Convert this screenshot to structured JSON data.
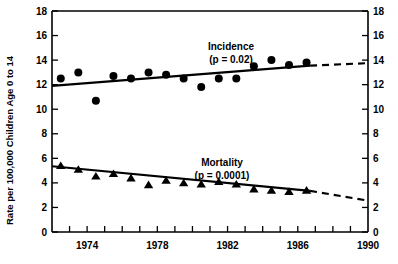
{
  "chart_data": {
    "type": "scatter",
    "title": "",
    "subtitle": "",
    "xlabel": "",
    "ylabel": "Rate per 100,000 Children Age 0 to 14",
    "ylabel_right": "",
    "xlim": [
      1972,
      1990
    ],
    "ylim": [
      0,
      18
    ],
    "grid": false,
    "legend_position": "inside-plot",
    "x_ticks": [
      1972,
      1973,
      1974,
      1975,
      1976,
      1977,
      1978,
      1979,
      1980,
      1981,
      1982,
      1983,
      1984,
      1985,
      1986,
      1987,
      1988,
      1989,
      1990
    ],
    "x_tick_labels": [
      "",
      "",
      "1974",
      "",
      "",
      "",
      "1978",
      "",
      "",
      "",
      "1982",
      "",
      "",
      "",
      "1986",
      "",
      "",
      "",
      "1990"
    ],
    "y_ticks": [
      0,
      2,
      4,
      6,
      8,
      10,
      12,
      14,
      16,
      18
    ],
    "y_tick_labels": [
      "0",
      "2",
      "4",
      "6",
      "8",
      "10",
      "12",
      "14",
      "16",
      "18"
    ],
    "y_ticks_right": [
      0,
      2,
      4,
      6,
      8,
      10,
      12,
      14,
      16,
      18
    ],
    "y_tick_labels_right": [
      "0",
      "2",
      "4",
      "6",
      "8",
      "10",
      "12",
      "14",
      "16",
      "18"
    ],
    "series": [
      {
        "name": "Incidence",
        "marker": "circle",
        "annotation": "Incidence",
        "annotation_stat": "(p = 0.02)",
        "p_value": 0.02,
        "x": [
          1972.5,
          1973.5,
          1974.5,
          1975.5,
          1976.5,
          1977.5,
          1978.5,
          1979.5,
          1980.5,
          1981.5,
          1982.5,
          1983.5,
          1984.5,
          1985.5,
          1986.5
        ],
        "values": [
          12.5,
          13.0,
          10.7,
          12.7,
          12.5,
          13.0,
          12.8,
          12.5,
          11.8,
          12.5,
          12.5,
          13.5,
          14.0,
          13.6,
          13.8
        ],
        "trend_solid": {
          "x": [
            1972.0,
            1986.7
          ],
          "y": [
            11.9,
            13.55
          ]
        },
        "trend_dashed": {
          "x": [
            1986.7,
            1990.0
          ],
          "y": [
            13.55,
            13.75
          ]
        }
      },
      {
        "name": "Mortality",
        "marker": "triangle",
        "annotation": "Mortality",
        "annotation_stat": "(p = 0.0001)",
        "p_value": 0.0001,
        "x": [
          1972.5,
          1973.5,
          1974.5,
          1975.5,
          1976.5,
          1977.5,
          1978.5,
          1979.5,
          1980.5,
          1981.5,
          1982.5,
          1983.5,
          1984.5,
          1985.5,
          1986.5
        ],
        "values": [
          5.4,
          5.1,
          4.55,
          4.75,
          4.4,
          3.85,
          4.2,
          4.0,
          3.9,
          4.1,
          3.9,
          3.5,
          3.4,
          3.3,
          3.4
        ],
        "trend_solid": {
          "x": [
            1972.0,
            1986.7
          ],
          "y": [
            5.35,
            3.35
          ]
        },
        "trend_dashed": {
          "x": [
            1986.7,
            1990.0
          ],
          "y": [
            3.35,
            2.55
          ]
        }
      }
    ]
  },
  "axes": {
    "y_left_title": "Rate per 100,000 Children Age 0 to 14"
  }
}
